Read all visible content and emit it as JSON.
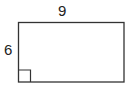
{
  "figure": {
    "shape": "rectangle",
    "width_label": "9",
    "height_label": "6",
    "right_angle_marker": true,
    "stroke_color": "#333333"
  }
}
